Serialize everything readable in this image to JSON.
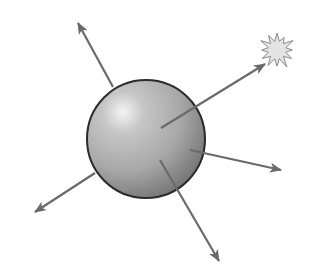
{
  "diagram": {
    "description": "Shaded gray sphere with five arrows radiating outward; one arrow points to a starburst",
    "colors": {
      "background": "#ffffff",
      "sphere_highlight": "#f4f4f4",
      "sphere_mid": "#a8a8a8",
      "sphere_shadow": "#6e6e6e",
      "sphere_outline": "#2a2a2a",
      "arrow": "#6a6a6a",
      "starburst_fill": "#e4e4e4",
      "starburst_stroke": "#8a8a8a"
    },
    "sphere": {
      "cx": 146,
      "cy": 139,
      "r": 59
    },
    "arrows": [
      {
        "id": "arrow-up-left",
        "x1": 113,
        "y1": 87,
        "x2": 78,
        "y2": 23
      },
      {
        "id": "arrow-up-right-to-star",
        "x1": 161,
        "y1": 128,
        "x2": 265,
        "y2": 64
      },
      {
        "id": "arrow-right",
        "x1": 190,
        "y1": 150,
        "x2": 281,
        "y2": 170
      },
      {
        "id": "arrow-down-left",
        "x1": 95,
        "y1": 173,
        "x2": 35,
        "y2": 212
      },
      {
        "id": "arrow-down-right",
        "x1": 160,
        "y1": 160,
        "x2": 219,
        "y2": 261
      }
    ],
    "starburst": {
      "cx": 277,
      "cy": 50,
      "r_outer": 17,
      "r_inner": 9,
      "points": 12
    }
  }
}
